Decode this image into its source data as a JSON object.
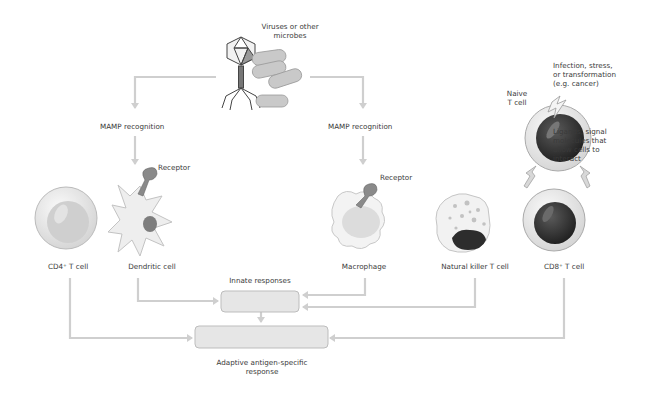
{
  "diagram": {
    "top_label": [
      "Viruses or other",
      "microbes"
    ],
    "recognition_left": "MAMP recognition",
    "recognition_right": "MAMP recognition",
    "receptor_left": "Receptor",
    "receptor_right": "Receptor",
    "trigger_label": [
      "Infection, stress,",
      "or transformation",
      "(e.g. cancer)"
    ],
    "naive_label": [
      "Naive",
      "T cell"
    ],
    "ligand_label": [
      "Ligands, signal",
      "molecules that",
      "allow cells to",
      "interact"
    ],
    "cells": [
      {
        "label": "CD4⁺ T cell"
      },
      {
        "label": "Dendritic cell"
      },
      {
        "label": "Macrophage"
      },
      {
        "label": "Natural killer T cell"
      },
      {
        "label": "CD8⁺ T cell"
      }
    ],
    "innate_label": "Innate responses",
    "adaptive_label": [
      "Adaptive antigen-specific",
      "response"
    ]
  },
  "colors": {
    "arrow": "#cfcfcf",
    "box_fill": "#e6e6e6",
    "box_stroke": "#bdbdbd",
    "cell_light": "#ececec",
    "nucleus_dark": "#2b2b2b",
    "receptor": "#8a8a8a"
  }
}
